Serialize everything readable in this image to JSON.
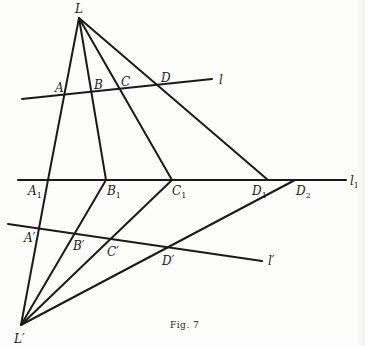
{
  "figure": {
    "caption": "Fig. 7",
    "centers": [
      {
        "id": "L",
        "label": "L"
      },
      {
        "id": "Lp",
        "label": "L′"
      }
    ],
    "lines": [
      {
        "id": "l",
        "label": "l"
      },
      {
        "id": "l1",
        "label": "l",
        "sub": "1"
      },
      {
        "id": "lp",
        "label": "l′"
      }
    ],
    "points": [
      {
        "id": "A",
        "label": "A",
        "sub": ""
      },
      {
        "id": "B",
        "label": "B",
        "sub": ""
      },
      {
        "id": "C",
        "label": "C",
        "sub": ""
      },
      {
        "id": "D",
        "label": "D",
        "sub": ""
      },
      {
        "id": "A1",
        "label": "A",
        "sub": "1"
      },
      {
        "id": "B1",
        "label": "B",
        "sub": "1"
      },
      {
        "id": "C1",
        "label": "C",
        "sub": "1"
      },
      {
        "id": "D1",
        "label": "D",
        "sub": "1"
      },
      {
        "id": "D2",
        "label": "D",
        "sub": "2"
      },
      {
        "id": "Ap",
        "label": "A′",
        "sub": ""
      },
      {
        "id": "Bp",
        "label": "B′",
        "sub": ""
      },
      {
        "id": "Cp",
        "label": "C′",
        "sub": ""
      },
      {
        "id": "Dp",
        "label": "D′",
        "sub": ""
      }
    ]
  }
}
